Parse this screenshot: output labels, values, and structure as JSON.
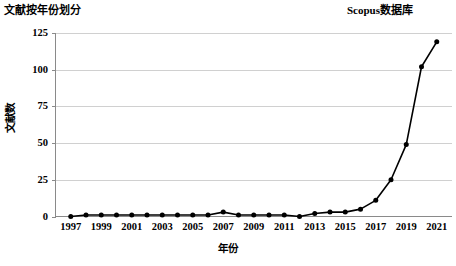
{
  "header": {
    "title_left": "文献按年份划分",
    "title_right": "Scopus数据库"
  },
  "chart_data": {
    "type": "line",
    "title": "文献按年份划分",
    "subtitle": "Scopus数据库",
    "xlabel": "年份",
    "ylabel": "文献数",
    "grid": true,
    "legend": "none",
    "xlim": [
      1996,
      2022
    ],
    "ylim": [
      0,
      125
    ],
    "yticks": [
      0,
      25,
      50,
      75,
      100,
      125
    ],
    "xticks": [
      1997,
      1999,
      2001,
      2003,
      2005,
      2007,
      2009,
      2011,
      2013,
      2015,
      2017,
      2019,
      2021
    ],
    "x": [
      1997,
      1998,
      1999,
      2000,
      2001,
      2002,
      2003,
      2004,
      2005,
      2006,
      2007,
      2008,
      2009,
      2010,
      2011,
      2012,
      2013,
      2014,
      2015,
      2016,
      2017,
      2018,
      2019,
      2020,
      2021
    ],
    "values": [
      0,
      1,
      1,
      1,
      1,
      1,
      1,
      1,
      1,
      1,
      3,
      1,
      1,
      1,
      1,
      0,
      2,
      3,
      3,
      5,
      11,
      25,
      49,
      102,
      119
    ],
    "series": [
      {
        "name": "文献数",
        "values": [
          0,
          1,
          1,
          1,
          1,
          1,
          1,
          1,
          1,
          1,
          3,
          1,
          1,
          1,
          1,
          0,
          2,
          3,
          3,
          5,
          11,
          25,
          49,
          102,
          119
        ]
      }
    ]
  },
  "ytick_labels": [
    "0",
    "25",
    "50",
    "75",
    "100",
    "125"
  ],
  "xtick_labels": [
    "1997",
    "1999",
    "2001",
    "2003",
    "2005",
    "2007",
    "2009",
    "2011",
    "2013",
    "2015",
    "2017",
    "2019",
    "2021"
  ]
}
